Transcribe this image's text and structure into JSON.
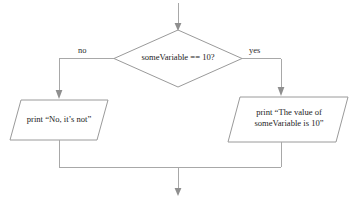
{
  "diagram": {
    "type": "flowchart",
    "nodes": {
      "decision": {
        "shape": "diamond",
        "text": "someVariable == 10?"
      },
      "output_no": {
        "shape": "parallelogram",
        "text": "print “No, it’s not”"
      },
      "output_yes": {
        "shape": "parallelogram",
        "line1": "print “The value of",
        "line2": "someVariable is 10”"
      }
    },
    "edges": {
      "no_label": "no",
      "yes_label": "yes"
    },
    "colors": {
      "stroke": "#9a9a9a",
      "connector": "#a8a8a8",
      "arrow": "#8f8f8f",
      "text": "#232323",
      "background": "#ffffff"
    }
  }
}
